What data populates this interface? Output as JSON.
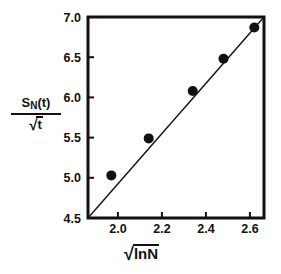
{
  "chart_data": {
    "type": "scatter",
    "title": "",
    "xlabel": "√lnN",
    "ylabel": "S_N(t)/√t",
    "xlabel_parts": {
      "radical": "√",
      "body": "lnN"
    },
    "ylabel_parts": {
      "numerator_base": "S",
      "numerator_sub": "N",
      "numerator_tail": "(t)",
      "denominator_radical": "√",
      "denominator_body": "t"
    },
    "xlim": [
      1.864,
      2.664
    ],
    "ylim": [
      4.5,
      7.0
    ],
    "xticks": [
      2.0,
      2.2,
      2.4,
      2.6,
      2.8
    ],
    "xticklabels": [
      "2.0",
      "2.2",
      "2.4",
      "2.6",
      "2.8"
    ],
    "yticks": [
      4.5,
      5.0,
      5.5,
      6.0,
      6.5,
      7.0
    ],
    "yticklabels": [
      "4.5",
      "5.0",
      "5.5",
      "6.0",
      "6.5",
      "7.0"
    ],
    "grid": false,
    "legend": null,
    "x": [
      1.97,
      2.14,
      2.34,
      2.48,
      2.62
    ],
    "y": [
      5.03,
      5.49,
      6.08,
      6.48,
      6.87
    ],
    "series": [
      {
        "name": "data",
        "marker": "filled-circle",
        "marker_size": 7,
        "color": "#111111",
        "points": [
          {
            "x": 1.97,
            "y": 5.03
          },
          {
            "x": 2.14,
            "y": 5.49
          },
          {
            "x": 2.34,
            "y": 6.08
          },
          {
            "x": 2.48,
            "y": 6.48
          },
          {
            "x": 2.62,
            "y": 6.87
          }
        ]
      }
    ],
    "fit_line": {
      "name": "linear-fit",
      "x_start": 1.864,
      "y_start": 4.5,
      "x_end": 2.664,
      "y_end": 7.0,
      "color": "#111111",
      "width": 1.4
    },
    "colors": {
      "axis": "#111111",
      "marker": "#111111",
      "line": "#111111",
      "background": "#ffffff"
    },
    "frame": {
      "left": 88,
      "right": 264,
      "top": 17,
      "bottom": 218
    }
  }
}
